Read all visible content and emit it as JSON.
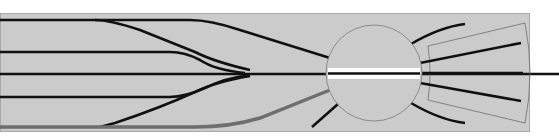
{
  "diagram": {
    "title": "Track plan: yard fan with turntable and engine shed",
    "colors": {
      "background": "#ffffff",
      "board": "#cbcbcb",
      "board_border": "#a9a9a9",
      "track": "#111111",
      "track_highlight": "#6e6e6e",
      "turntable_outline": "#7a7a7a",
      "bridge": "#ffffff",
      "shed_outline": "#6e6e6e"
    },
    "board": {
      "x": 0,
      "y": 13,
      "width": 529,
      "height": 118
    },
    "yard_tracks": [
      {
        "id": "track-1",
        "path": "M0 20 L95 20 Q110 20 140 30 L195 52 Q215 62 250 70"
      },
      {
        "id": "track-1-main",
        "path": "M95 20 L190 20 Q210 20 240 30 L330 58"
      },
      {
        "id": "track-2",
        "path": "M0 52 L170 52 Q185 52 200 60 Q215 70 245 73"
      },
      {
        "id": "track-3",
        "path": "M0 74 L560 74"
      },
      {
        "id": "track-4",
        "path": "M0 97 L170 97 Q185 97 205 88 Q225 78 250 75"
      },
      {
        "id": "track-5",
        "path": "M100 127 L115 123 Q160 108 195 92 Q215 82 250 76"
      }
    ],
    "highlighted_track": {
      "id": "track-6",
      "path": "M0 127 L195 127 Q230 127 260 118 L330 90"
    },
    "turntable": {
      "cx": 374,
      "cy": 73,
      "r": 48,
      "bridge": {
        "x": 328,
        "y": 68,
        "width": 92,
        "height": 11
      }
    },
    "turntable_spurs": [
      {
        "id": "spur-upper",
        "path": "M411 44 Q440 27 465 24"
      },
      {
        "id": "spur-lower",
        "path": "M411 103 Q440 120 465 123"
      },
      {
        "id": "spur-lower-left",
        "path": "M338 104 L312 127"
      }
    ],
    "shed": {
      "outline": "M428 46 L525 23 Q535 73 525 123 L428 100 Q432 73 428 46 Z",
      "tracks": [
        {
          "id": "shed-track-1",
          "path": "M420 63 L521 43"
        },
        {
          "id": "shed-track-2",
          "path": "M420 73 L523 73"
        },
        {
          "id": "shed-track-3",
          "path": "M420 83 L521 101"
        }
      ]
    }
  }
}
